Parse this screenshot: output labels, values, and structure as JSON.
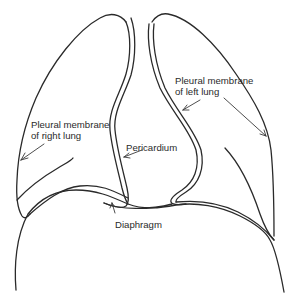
{
  "diagram": {
    "labels": {
      "right_lung_line1": "Pleural membrane",
      "right_lung_line2": "of right lung",
      "left_lung_line1": "Pleural membrane",
      "left_lung_line2": "of left lung",
      "pericardium": "Pericardium",
      "diaphragm": "Diaphragm"
    },
    "colors": {
      "stroke": "#2a2a2a",
      "background": "#ffffff"
    }
  }
}
